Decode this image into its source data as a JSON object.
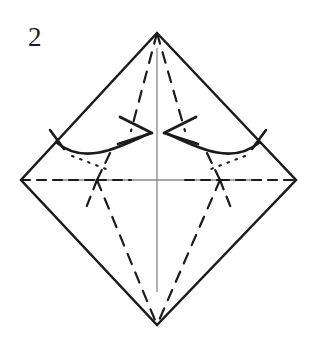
{
  "figure": {
    "kind": "origami-fold-diagram",
    "step_label": "2",
    "caption": "",
    "background_color": "#ffffff",
    "ink_color": "#1b1b1b",
    "thin_line_color": "#8a8a8a",
    "canvas": {
      "width": 321,
      "height": 338
    }
  },
  "shape": {
    "name": "square-rotated-45-diamond",
    "vertices": {
      "top": {
        "x": 157,
        "y": 33
      },
      "left": {
        "x": 21,
        "y": 180
      },
      "right": {
        "x": 296,
        "y": 180
      },
      "bottom": {
        "x": 157,
        "y": 325
      }
    },
    "edge_style": "solid",
    "edge_width": 2.4,
    "edge_color": "#1b1b1b"
  },
  "axes": {
    "vertical": {
      "x1": 157,
      "y1": 48,
      "x2": 157,
      "y2": 292,
      "color": "#8a8a8a",
      "width": 1.3
    },
    "horizontal": {
      "x1": 56,
      "y1": 180,
      "x2": 262,
      "y2": 180,
      "color": "#8a8a8a",
      "width": 1.3
    }
  },
  "crease_lines": [
    {
      "id": "horizontal-diagonal-left",
      "style": "dashed",
      "points": "21,180 97,180",
      "dash": "9 7"
    },
    {
      "id": "horizontal-diagonal-right",
      "style": "dashed",
      "points": "220,180 296,180",
      "dash": "9 7"
    },
    {
      "id": "horizontal-diagonal-mid-left",
      "style": "dashed",
      "points": "97,180 131,180",
      "dash": "9 7"
    },
    {
      "id": "horizontal-diagonal-mid-right",
      "style": "dashed",
      "points": "185,180 220,180",
      "dash": "9 7"
    },
    {
      "id": "apex-to-left-arrowtip",
      "style": "dashed",
      "points": "157,33 131,131",
      "dash": "11 9"
    },
    {
      "id": "apex-to-right-arrowtip",
      "style": "dashed",
      "points": "157,33 185,131",
      "dash": "11 9"
    },
    {
      "id": "left-junction-to-bottom",
      "style": "dashed",
      "points": "97,180 157,325",
      "dash": "11 9"
    },
    {
      "id": "right-junction-to-bottom",
      "style": "dashed",
      "points": "220,180 157,325",
      "dash": "11 9"
    },
    {
      "id": "left-junction-upper-spur",
      "style": "dashed",
      "points": "97,180 110,152",
      "dash": "11 8"
    },
    {
      "id": "right-junction-upper-spur",
      "style": "dashed",
      "points": "220,180 207,152",
      "dash": "11 8"
    },
    {
      "id": "left-junction-lower-spur",
      "style": "dashed",
      "points": "97,180 88,205",
      "dash": "10 8"
    },
    {
      "id": "right-junction-lower-spur",
      "style": "dashed",
      "points": "220,180 229,205",
      "dash": "10 8"
    }
  ],
  "dotted_lines": [
    {
      "id": "left-hidden-edge-dots",
      "style": "dotted",
      "points": "70,155 104,168",
      "dash": "1.6 7"
    },
    {
      "id": "right-hidden-edge-dots",
      "style": "dotted",
      "points": "247,155 213,168",
      "dash": "1.6 7"
    }
  ],
  "arrows": [
    {
      "id": "left-fold-arrow",
      "direction": "right-inward",
      "path": "M 57,143 C 85,165 120,146 150,133",
      "tip": {
        "x": 152,
        "y": 133
      },
      "head_angle_deg": -24,
      "tick": {
        "x1": 50,
        "y1": 131,
        "x2": 64,
        "y2": 148
      }
    },
    {
      "id": "right-fold-arrow",
      "direction": "left-inward",
      "path": "M 258,143 C 230,165 196,146 166,133",
      "tip": {
        "x": 164,
        "y": 133
      },
      "head_angle_deg": 204,
      "tick": {
        "x1": 265,
        "y1": 131,
        "x2": 251,
        "y2": 148
      }
    }
  ]
}
